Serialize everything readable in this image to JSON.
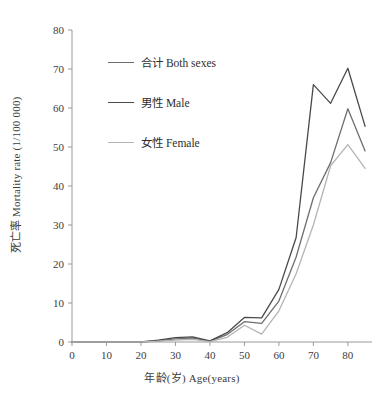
{
  "chart_data": {
    "type": "line",
    "title": "",
    "xlabel": "年龄(岁) Age(years)",
    "ylabel": "死亡率 Mortality rate (1/100 000)",
    "xlim": [
      0,
      87
    ],
    "ylim": [
      0,
      80
    ],
    "xticks": [
      0,
      10,
      20,
      30,
      40,
      50,
      60,
      70,
      80
    ],
    "yticks": [
      0,
      10,
      20,
      30,
      40,
      50,
      60,
      70,
      80
    ],
    "grid": false,
    "legend_position": "upper-left-inside",
    "x": [
      0,
      5,
      10,
      15,
      20,
      25,
      30,
      35,
      40,
      45,
      50,
      55,
      60,
      65,
      70,
      75,
      80,
      85
    ],
    "series": [
      {
        "name": "合计 Both sexes",
        "color": "#6e6e6e",
        "values": [
          0,
          0,
          0,
          0,
          0,
          0.3,
          0.8,
          1.0,
          0.2,
          1.9,
          5.2,
          4.8,
          10.5,
          21.8,
          37.0,
          46.0,
          59.8,
          49.0
        ]
      },
      {
        "name": "男性 Male",
        "color": "#4a4a4a",
        "values": [
          0,
          0,
          0,
          0,
          0,
          0.5,
          1.1,
          1.3,
          0.3,
          2.4,
          6.3,
          6.2,
          13.5,
          26.8,
          66.0,
          61.2,
          70.2,
          55.3
        ]
      },
      {
        "name": "女性 Female",
        "color": "#b4b4b4",
        "values": [
          0,
          0,
          0,
          0,
          0,
          0.2,
          0.5,
          0.7,
          0.1,
          1.2,
          4.3,
          2.0,
          8.0,
          17.5,
          30.0,
          45.2,
          50.6,
          44.5
        ]
      }
    ]
  },
  "legend": {
    "items": [
      {
        "label": "合计 Both sexes",
        "color": "#6e6e6e"
      },
      {
        "label": "男性 Male",
        "color": "#4a4a4a"
      },
      {
        "label": "女性 Female",
        "color": "#b4b4b4"
      }
    ]
  },
  "axes": {
    "x_title": "年龄(岁) Age(years)",
    "y_title": "死亡率 Mortality rate (1/100 000)",
    "x_tick_labels": [
      "0",
      "10",
      "20",
      "30",
      "40",
      "50",
      "60",
      "70",
      "80"
    ],
    "y_tick_labels": [
      "0",
      "10",
      "20",
      "30",
      "40",
      "50",
      "60",
      "70",
      "80"
    ],
    "axis_color": "#9a9a9a"
  }
}
